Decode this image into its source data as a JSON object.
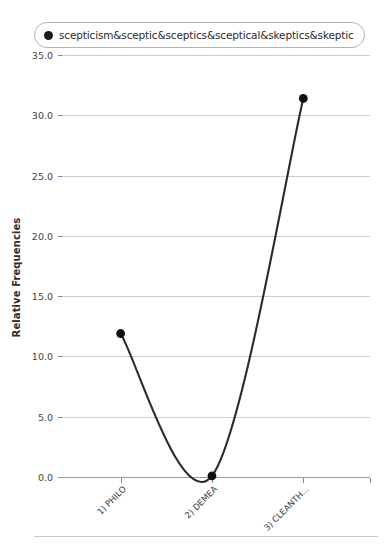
{
  "legend": {
    "position": "top-left",
    "marker_shape": "circle",
    "marker_color": "#1a1a1a",
    "entries": [
      {
        "label": "scepticism&sceptic&sceptics&sceptical&skeptics&skeptic"
      }
    ]
  },
  "axes": {
    "y_title": "Relative Frequencies",
    "y_ticks": [
      "0.0",
      "5.0",
      "10.0",
      "15.0",
      "20.0",
      "25.0",
      "30.0",
      "35.0"
    ],
    "x_ticks": [
      "1) PHILO",
      "2) DEMEA",
      "3) CLEANTH..."
    ]
  },
  "chart_data": {
    "type": "line",
    "title": "",
    "subtitle": "",
    "xlabel": "",
    "ylabel": "Relative Frequencies",
    "categories": [
      "1) PHILO",
      "2) DEMEA",
      "3) CLEANTH..."
    ],
    "series": [
      {
        "name": "scepticism&sceptic&sceptics&sceptical&skeptics&skeptic",
        "color": "#2b2b2b",
        "marker": "circle",
        "interpolation": "spline",
        "values": [
          11.9,
          0.1,
          31.4
        ]
      }
    ],
    "ylim": [
      0.0,
      35.0
    ],
    "ytick_step": 5.0,
    "grid": true,
    "grid_axis": "y",
    "legend_position": "top-left"
  }
}
